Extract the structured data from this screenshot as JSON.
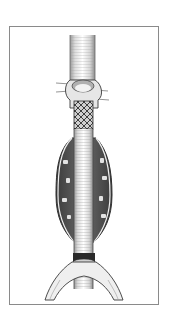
{
  "figure": {
    "alt": "Illustration of an aortic stent graft anchored below the renal arteries, spanning an aneurysm sac down to the iliac bifurcation",
    "parts": {
      "aorta": "aorta-upper",
      "renal_arteries": "renal-arteries",
      "stent": "proximal-stent",
      "graft": "graft-tube",
      "aneurysm": "aneurysm-sac",
      "bifurcation": "iliac-bifurcation"
    },
    "colors": {
      "line": "#3a3a3a",
      "shade": "#6b6b6b",
      "thrombus": "#4a4a4a",
      "highlight": "#e8e8e8",
      "frame": "#8a8a8a"
    }
  }
}
